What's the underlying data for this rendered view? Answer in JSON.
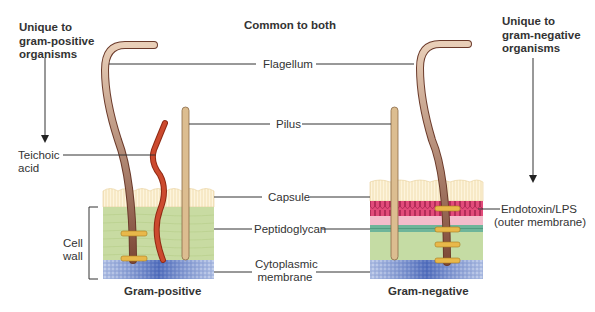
{
  "headers": {
    "gram_positive_unique": [
      "Unique to",
      "gram-positive",
      "organisms"
    ],
    "common": "Common to both",
    "gram_negative_unique": [
      "Unique to",
      "gram-negative",
      "organisms"
    ]
  },
  "labels": {
    "flagellum": "Flagellum",
    "pilus": "Pilus",
    "capsule": "Capsule",
    "peptidoglycan": "Peptidoglycan",
    "cytoplasmic_membrane": [
      "Cytoplasmic",
      "membrane"
    ],
    "teichoic_acid": [
      "Teichoic",
      "acid"
    ],
    "cell_wall": [
      "Cell",
      "wall"
    ],
    "endotoxin": [
      "Endotoxin/LPS",
      "(outer membrane)"
    ]
  },
  "captions": {
    "gram_positive": "Gram-positive",
    "gram_negative": "Gram-negative"
  },
  "colors": {
    "capsule": "#fbf1d6",
    "peptidoglycan": "#c9dca3",
    "membrane": "#5f7fc4",
    "lps": "#e04a78",
    "periplasm": "#f4bccb",
    "outer_peptidoglycan": "#6fb59a",
    "flagellum": "#8c5540",
    "pilus": "#d9b98a",
    "teichoic": "#c0452a",
    "ring": "#e8b84a"
  }
}
